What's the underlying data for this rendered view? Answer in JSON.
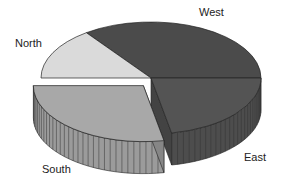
{
  "chart_data": {
    "type": "pie",
    "style": "3d-exploded",
    "title": "",
    "categories": [
      "West",
      "North",
      "South",
      "East"
    ],
    "values": [
      35,
      15,
      28,
      22
    ],
    "unit": "%",
    "exploded": [
      "South"
    ],
    "colors": {
      "West": "#4b4b4b",
      "North": "#dadada",
      "South": "#a8a8a8",
      "East": "#545454"
    },
    "legend": "none (labels placed beside slices)"
  },
  "labels": {
    "west": "West",
    "north": "North",
    "south": "South",
    "east": "East"
  }
}
